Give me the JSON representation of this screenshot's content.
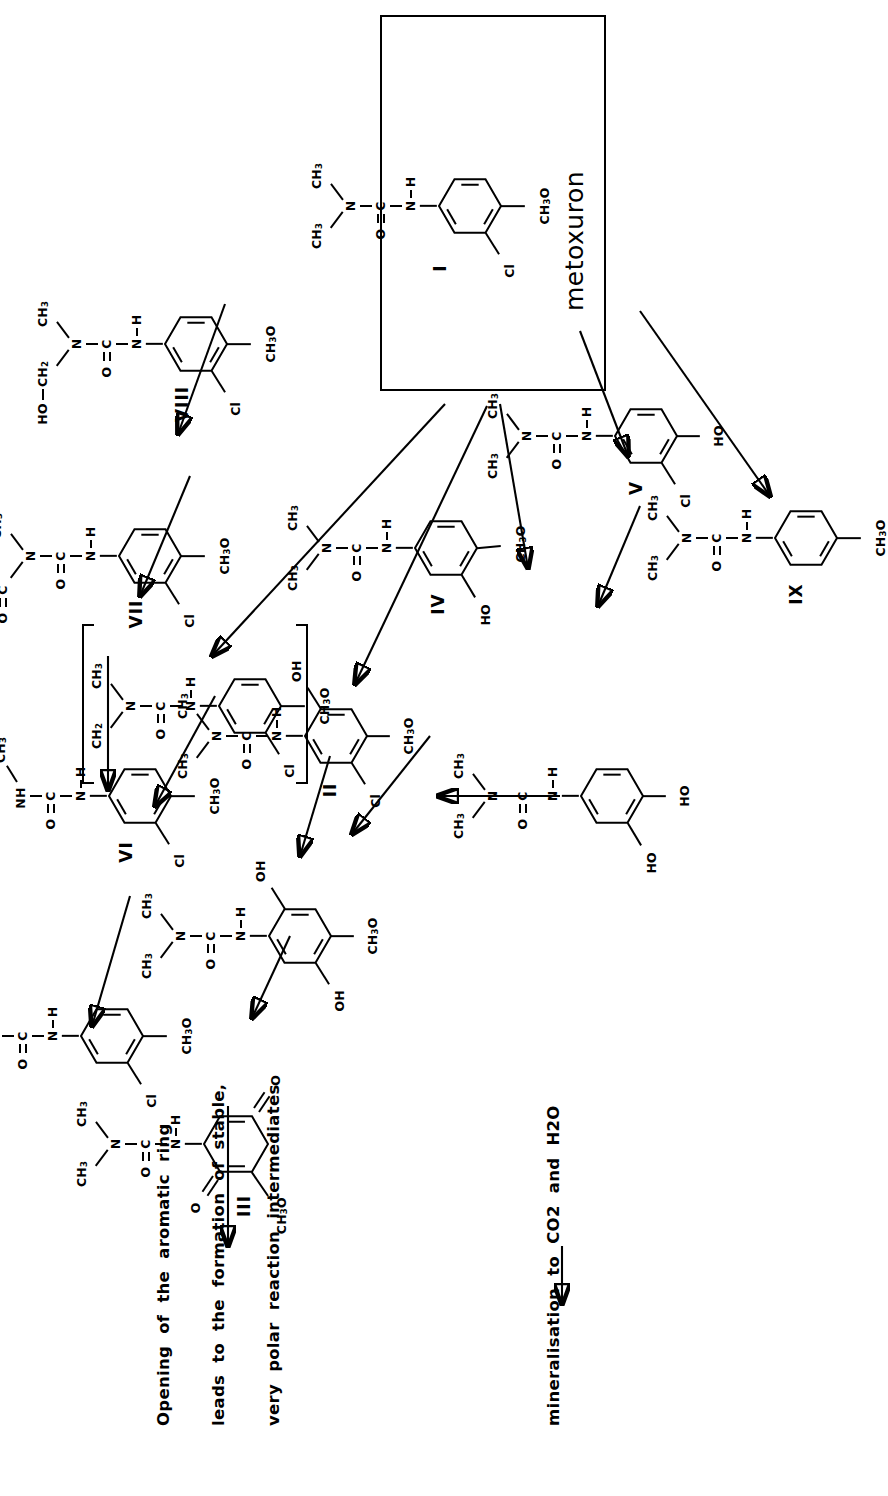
{
  "figure": {
    "kind": "chemical-degradation-pathway",
    "subject": "metoxuron",
    "orientation": "rotated 90 degrees counter-clockwise"
  },
  "labels": {
    "metoxuron_caption": "metoxuron",
    "roman": {
      "I": "I",
      "II": "II",
      "III": "III",
      "IV": "IV",
      "V": "V",
      "VI": "VI",
      "VII": "VII",
      "VIII": "VIII",
      "IX": "IX"
    }
  },
  "atoms": {
    "CH3": "CH3",
    "CH2": "CH2",
    "N": "N",
    "C": "C",
    "O": "O",
    "H": "H",
    "NH": "NH",
    "NH2": "NH2",
    "Cl": "Cl",
    "OH": "OH",
    "HO": "HO",
    "CH3O": "CH3O",
    "OCH3": "OCH3",
    "HOCH2": "HO-CH2"
  },
  "notes": {
    "line1": "Opening  of  the  aromatic  ring",
    "line2": "leads  to  the  formation  of  stable,",
    "line3": "very  polar  reaction  intermediates",
    "line4": "mineralisation  to  CO2  and  H2O"
  },
  "compounds": [
    {
      "id": "I",
      "name": "metoxuron",
      "label": "I",
      "substituents": [
        "Cl",
        "CH3O"
      ],
      "side": "N(CH3)2 urea",
      "boxed": true
    },
    {
      "id": "II",
      "label": "II",
      "substituents": [
        "Cl",
        "CH3O",
        "OH"
      ],
      "side": "N(CH3)2 urea"
    },
    {
      "id": "III",
      "label": "III",
      "substituents": [
        "=O",
        "=O",
        "CH3O"
      ],
      "side": "N(CH3)2 urea",
      "ring": "quinone"
    },
    {
      "id": "IV",
      "label": "IV",
      "substituents": [
        "HO",
        "CH3O"
      ],
      "side": "N(CH3)2 urea"
    },
    {
      "id": "V",
      "label": "V",
      "substituents": [
        "Cl",
        "HO"
      ],
      "side": "N(CH3)2 urea"
    },
    {
      "id": "VI",
      "label": "VI",
      "substituents": [
        "Cl",
        "CH3O"
      ],
      "side": "NH-CH3 urea"
    },
    {
      "id": "VII",
      "label": "VII",
      "substituents": [
        "Cl",
        "CH3O"
      ],
      "side": "N(CHO)(CH3) urea"
    },
    {
      "id": "VIII",
      "label": "VIII",
      "substituents": [
        "Cl",
        "CH3O"
      ],
      "side": "N(CH2OH)(CH3) urea"
    },
    {
      "id": "IX",
      "label": "IX",
      "substituents": [
        "CH3O"
      ],
      "side": "N(CH3)2 urea"
    },
    {
      "id": "R",
      "label": "",
      "substituents": [
        "Cl",
        "CH3O"
      ],
      "side": "N(CH2 radical)(CH3) urea",
      "bracketed": true
    },
    {
      "id": "A",
      "label": "",
      "substituents": [
        "Cl",
        "CH3O"
      ],
      "side": "NH2 urea",
      "terminal": true
    },
    {
      "id": "B",
      "label": "",
      "substituents": [
        "OH",
        "OH",
        "CH3O"
      ],
      "side": "N(CH3)2 urea"
    },
    {
      "id": "C",
      "label": "",
      "substituents": [
        "HO",
        "HO"
      ],
      "side": "N(CH3)2 urea"
    }
  ],
  "colors": {
    "ink": "#000000",
    "paper": "#ffffff"
  }
}
